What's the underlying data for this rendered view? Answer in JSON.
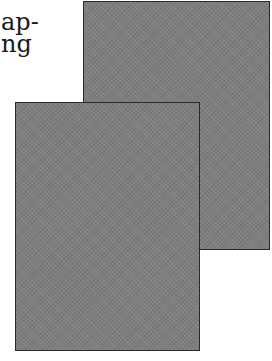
{
  "text": {
    "line1": "ap-",
    "line2": "ng"
  },
  "pages": [
    {
      "name": "back-page",
      "color": "#7e7e7e",
      "border": "#2a2a2a"
    },
    {
      "name": "front-page",
      "color": "#7e7e7e",
      "border": "#2a2a2a"
    }
  ]
}
